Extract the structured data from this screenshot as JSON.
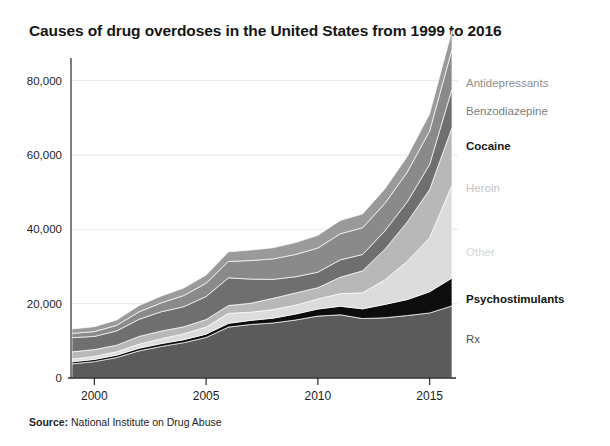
{
  "title": "Causes of drug overdoses in the United States from 1999 to 2016",
  "source_prefix": "Source:",
  "source_text": " National Institute on Drug Abuse",
  "axis": {
    "y_ticks": [
      "0",
      "20,000",
      "40,000",
      "60,000",
      "80,000"
    ],
    "x_ticks": [
      "2000",
      "2005",
      "2010",
      "2015"
    ]
  },
  "series_labels": [
    {
      "name": "Antidepressants",
      "color": "#8f8f8f",
      "bold": false
    },
    {
      "name": "Benzodiazepine",
      "color": "#7d7d7d",
      "bold": false
    },
    {
      "name": "Cocaine",
      "color": "#1a1a1a",
      "bold": true
    },
    {
      "name": "Heroin",
      "color": "#c4c4c4",
      "bold": false
    },
    {
      "name": "Other",
      "color": "#d6d6d6",
      "bold": false
    },
    {
      "name": "Psychostimulants",
      "color": "#111111",
      "bold": true
    },
    {
      "name": "Rx",
      "color": "#4f4f4f",
      "bold": false
    }
  ],
  "chart_data": {
    "type": "area",
    "title": "Causes of drug overdoses in the United States from 1999 to 2016",
    "xlabel": "",
    "ylabel": "",
    "xlim": [
      1999,
      2016
    ],
    "ylim": [
      0,
      85000
    ],
    "grid": true,
    "legend_position": "right-inline",
    "stacked": true,
    "x": [
      1999,
      2000,
      2001,
      2002,
      2003,
      2004,
      2005,
      2006,
      2007,
      2008,
      2009,
      2010,
      2011,
      2012,
      2013,
      2014,
      2015,
      2016
    ],
    "xtick_labels": [
      "2000",
      "2005",
      "2010",
      "2015"
    ],
    "ytick_labels": [
      "0",
      "20,000",
      "40,000",
      "60,000",
      "80,000"
    ],
    "ytick_values": [
      0,
      20000,
      40000,
      60000,
      80000
    ],
    "series": [
      {
        "name": "Rx",
        "color": "#5b5b5b",
        "values": [
          3800,
          4400,
          5500,
          7300,
          8500,
          9500,
          10900,
          13700,
          14400,
          14800,
          15600,
          16650,
          17000,
          16000,
          16200,
          16800,
          17500,
          19400
        ]
      },
      {
        "name": "Psychostimulants",
        "color": "#0d0d0d",
        "values": [
          550,
          600,
          650,
          700,
          750,
          800,
          900,
          1000,
          1100,
          1300,
          1600,
          1900,
          2300,
          2600,
          3600,
          4300,
          5700,
          7500
        ]
      },
      {
        "name": "Other",
        "color": "#dcdcdc",
        "values": [
          730,
          800,
          900,
          1100,
          1300,
          1600,
          1900,
          2700,
          2200,
          2300,
          2400,
          2700,
          3400,
          4300,
          6600,
          10300,
          14500,
          25000
        ]
      },
      {
        "name": "Heroin",
        "color": "#b8b8b8",
        "values": [
          1960,
          1840,
          1780,
          2090,
          2080,
          1880,
          2010,
          2090,
          2400,
          3040,
          3280,
          3036,
          4397,
          5925,
          8257,
          10574,
          12989,
          15469
        ]
      },
      {
        "name": "Cocaine",
        "color": "#6f6f6f",
        "values": [
          3820,
          3540,
          3830,
          4600,
          5200,
          5400,
          6200,
          7450,
          6500,
          5100,
          4350,
          4180,
          4680,
          4400,
          4940,
          5420,
          6780,
          10375
        ]
      },
      {
        "name": "Benzodiazepine",
        "color": "#8a8a8a",
        "values": [
          1135,
          1300,
          1500,
          2000,
          2400,
          3000,
          3600,
          4400,
          5000,
          5500,
          6000,
          6500,
          7000,
          7200,
          7400,
          8000,
          9000,
          10684
        ]
      },
      {
        "name": "Antidepressants",
        "color": "#9a9a9a",
        "values": [
          1200,
          1300,
          1450,
          1700,
          1850,
          2000,
          2200,
          2600,
          2800,
          3000,
          3200,
          3400,
          3600,
          3700,
          3900,
          4200,
          4600,
          5050
        ]
      }
    ]
  },
  "geometry": {
    "plot_left": 72,
    "plot_right": 452,
    "plot_top": 62,
    "plot_bottom": 378
  }
}
